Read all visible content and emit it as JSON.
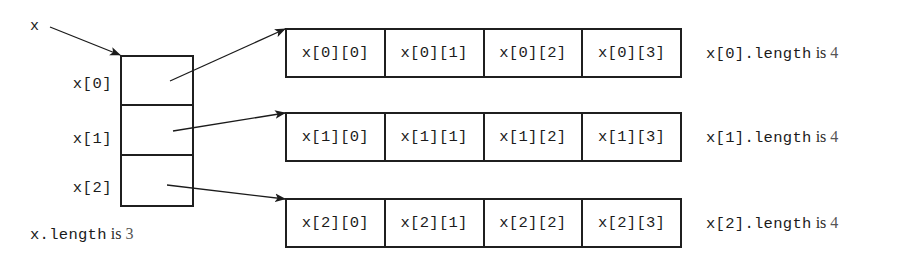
{
  "diagram": {
    "background_color": "#ffffff",
    "line_color": "#1f1f1f",
    "text_color": "#1b1b1b"
  },
  "pointer": {
    "label": "x",
    "arrow_name": "x-reference-arrow"
  },
  "outer_array": {
    "length_code": "x.length",
    "length_word": "is",
    "length_value": "3",
    "cells": [
      {
        "label": "x[0]"
      },
      {
        "label": "x[1]"
      },
      {
        "label": "x[2]"
      }
    ]
  },
  "rows": [
    {
      "index": 0,
      "length_code": "x[0].length",
      "length_word": "is",
      "length_value": "4",
      "cells": [
        "x[0][0]",
        "x[0][1]",
        "x[0][2]",
        "x[0][3]"
      ]
    },
    {
      "index": 1,
      "length_code": "x[1].length",
      "length_word": "is",
      "length_value": "4",
      "cells": [
        "x[1][0]",
        "x[1][1]",
        "x[1][2]",
        "x[1][3]"
      ]
    },
    {
      "index": 2,
      "length_code": "x[2].length",
      "length_word": "is",
      "length_value": "4",
      "cells": [
        "x[2][0]",
        "x[2][1]",
        "x[2][2]",
        "x[2][3]"
      ]
    }
  ]
}
